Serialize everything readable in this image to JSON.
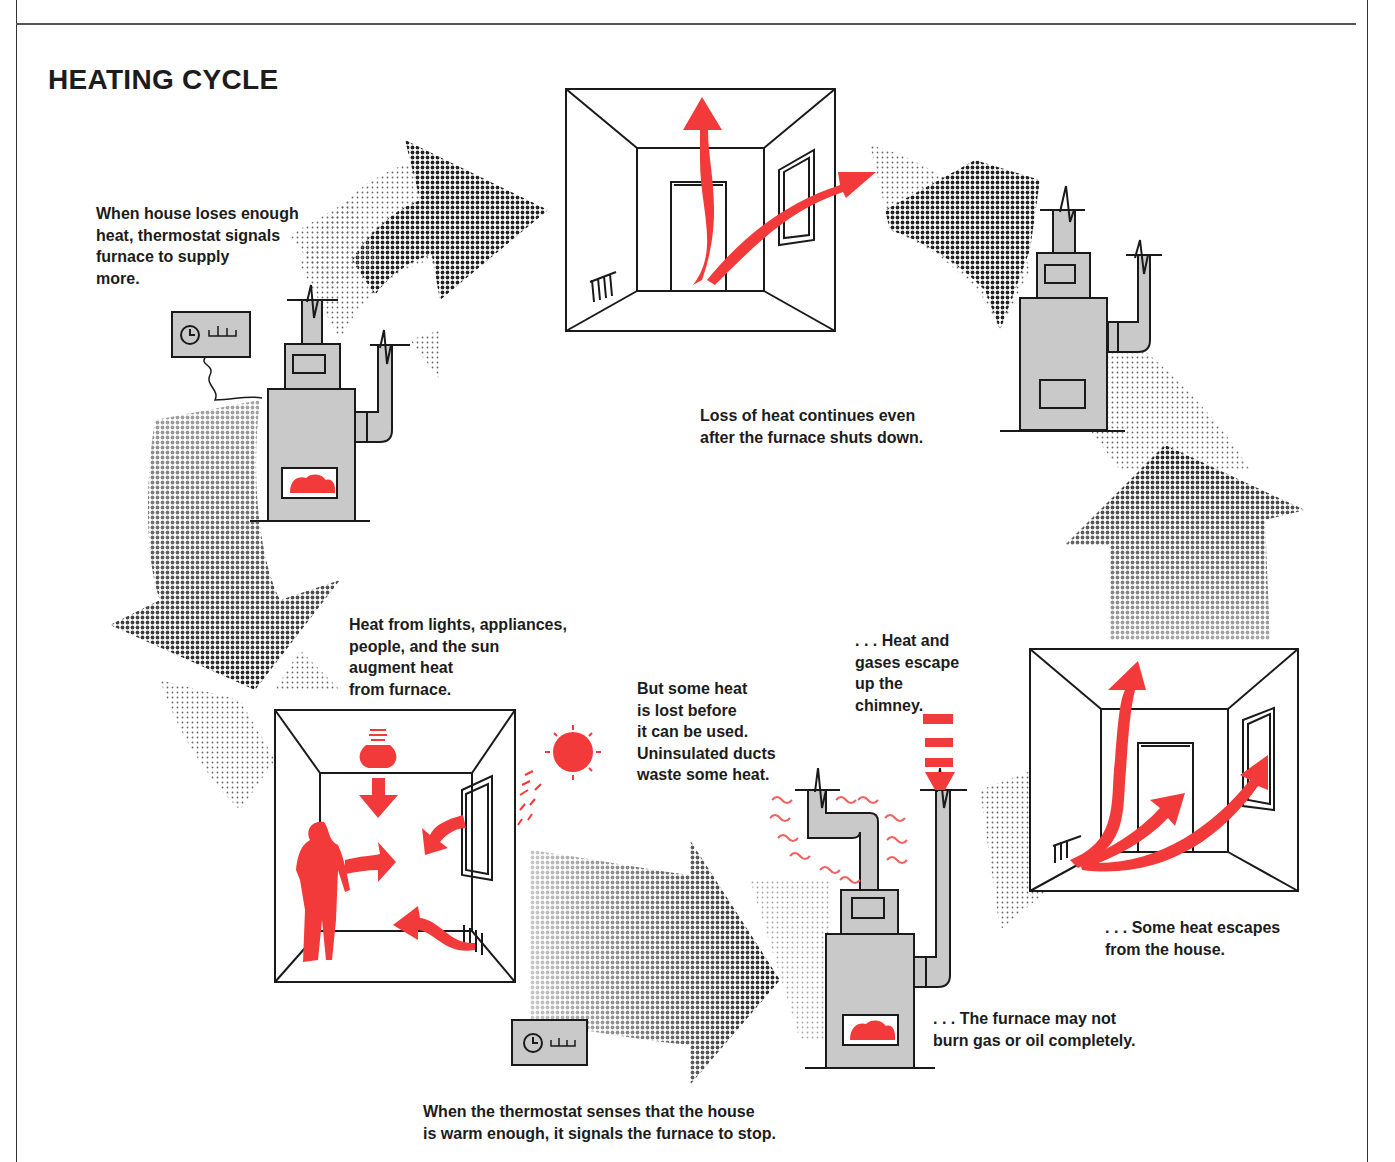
{
  "diagram": {
    "title": "HEATING CYCLE",
    "colors": {
      "heat_red": "#f23a3a",
      "furnace_gray": "#c9c9c9",
      "line_black": "#1a1a1a",
      "halftone_dark": "#2a2a2a",
      "halftone_light": "#9a9a9a"
    },
    "captions": [
      {
        "id": "thermostat-signals",
        "text": "When house loses enough\nheat, thermostat signals\nfurnace to supply\nmore."
      },
      {
        "id": "heat-loss-continues",
        "text": "Loss of heat continues even\nafter the furnace shuts down."
      },
      {
        "id": "heat-augment",
        "text": "Heat from lights, appliances,\npeople, and the sun\naugment heat\nfrom furnace."
      },
      {
        "id": "heat-lost-ducts",
        "text": "But some heat\nis lost before\nit can be used.\nUninsulated ducts\nwaste some heat."
      },
      {
        "id": "chimney-escape",
        "text": ". . . Heat and\ngases escape\nup the\nchimney."
      },
      {
        "id": "house-escape",
        "text": ". . . Some heat escapes\nfrom the house."
      },
      {
        "id": "incomplete-burn",
        "text": ". . . The furnace may not\nburn gas or oil completely."
      },
      {
        "id": "thermostat-stop",
        "text": "When the thermostat senses that the house\nis warm enough, it signals the furnace to stop."
      }
    ],
    "stages": [
      {
        "id": "room-heat-loss-top",
        "icon": "room-with-heat-arrows"
      },
      {
        "id": "furnace-off-right",
        "icon": "furnace-off"
      },
      {
        "id": "room-heat-escape-right",
        "icon": "room-with-heat-arrows"
      },
      {
        "id": "furnace-losses-bottom",
        "icon": "furnace-with-losses"
      },
      {
        "id": "room-heat-gains-left",
        "icon": "room-with-heat-sources"
      },
      {
        "id": "furnace-on-left",
        "icon": "furnace-with-thermostat"
      }
    ],
    "cycle_arrows": [
      "arrow-top-left",
      "arrow-top-right",
      "arrow-right-up",
      "arrow-bottom-right",
      "arrow-left-down"
    ]
  }
}
